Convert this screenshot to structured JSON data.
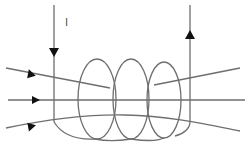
{
  "diagram": {
    "current_label": "I",
    "colors": {
      "wire": "#6e6e6e",
      "arrow": "#111111",
      "background": "#ffffff"
    },
    "elements": {
      "left_lead": {
        "direction": "down"
      },
      "right_lead": {
        "direction": "up"
      },
      "coil_turns": 3,
      "field_lines": 3,
      "field_arrows_direction": "right"
    }
  }
}
